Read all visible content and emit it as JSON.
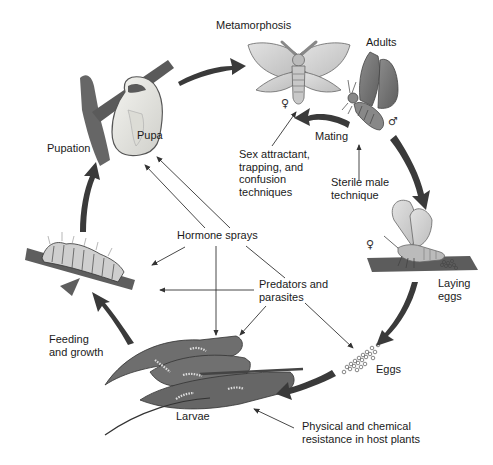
{
  "diagram": {
    "type": "insect-life-cycle",
    "colors": {
      "background": "#ffffff",
      "cycle_arrow": "#3a3a3a",
      "thin_arrow": "#333333",
      "leaf": "#6e6e6e",
      "leaf_dark": "#4a4a4a",
      "pupa": "#e6e6e2",
      "branch": "#5a5a5a",
      "female_wing": "#d4d4d4",
      "male_wing": "#7a7a7a",
      "text": "#1a1a1a"
    },
    "stages": {
      "metamorphosis": "Metamorphosis",
      "adults": "Adults",
      "mating": "Mating",
      "laying_eggs": "Laying\neggs",
      "eggs": "Eggs",
      "larvae": "Larvae",
      "feeding_growth": "Feeding\nand growth",
      "pupation": "Pupation",
      "pupa": "Pupa"
    },
    "controls": {
      "sex_attractant": "Sex attractant,\ntrapping, and\nconfusion\ntechniques",
      "sterile_male": "Sterile male\ntechnique",
      "hormone_sprays": "Hormone sprays",
      "predators_parasites": "Predators and\nparasites",
      "host_resistance": "Physical and chemical\nresistance in host plants"
    },
    "symbols": {
      "female_1": "♀",
      "male": "♂",
      "female_2": "♀"
    }
  }
}
